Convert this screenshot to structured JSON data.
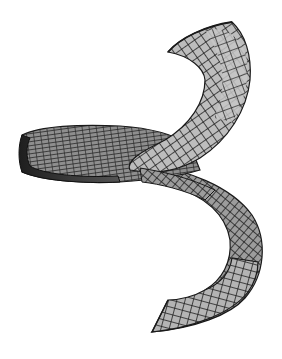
{
  "figure": {
    "title": "Helicoidal ribbon surface",
    "colors": {
      "background": "#ffffff",
      "face_light": "#c8c8c8",
      "face_mid": "#9a9a9a",
      "face_dark": "#4a4a4a",
      "edge": "#1a1a1a",
      "side_wall": "#2a2a2a"
    }
  }
}
